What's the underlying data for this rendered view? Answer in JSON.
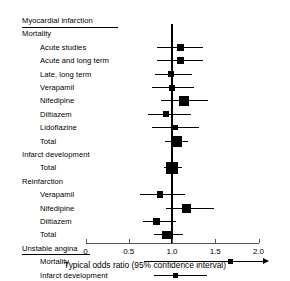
{
  "chart_data": {
    "type": "scatter",
    "subtype": "forest-plot",
    "title": "",
    "xlabel": "Typical odds ratio (95% confidence interval)",
    "ylabel": "",
    "xlim": [
      0,
      2.0
    ],
    "xticks": [
      0,
      0.5,
      1.0,
      1.5,
      2.0
    ],
    "xticklabels": [
      "0",
      "0.5",
      "1.0",
      "1.5",
      "2.0"
    ],
    "null_line": 1.0,
    "grid": false,
    "legend": null,
    "sections": [
      {
        "header": "Myocardial infarction",
        "underline": true,
        "subsections": [
          {
            "header": "Mortality",
            "underline": false,
            "rows": [
              {
                "label": "Acute studies",
                "or": 1.1,
                "ci_low": 0.83,
                "ci_high": 1.36,
                "marker_size": 7.0,
                "truncated_high": false
              },
              {
                "label": "Acute and long term",
                "or": 1.1,
                "ci_low": 0.83,
                "ci_high": 1.36,
                "marker_size": 7.0,
                "truncated_high": false
              },
              {
                "label": "Late, long term",
                "or": 0.99,
                "ci_low": 0.8,
                "ci_high": 1.23,
                "marker_size": 5.4,
                "truncated_high": false
              },
              {
                "label": "Verapamil",
                "or": 1.0,
                "ci_low": 0.77,
                "ci_high": 1.25,
                "marker_size": 6.0,
                "truncated_high": false
              },
              {
                "label": "Nifedipine",
                "or": 1.14,
                "ci_low": 0.87,
                "ci_high": 1.42,
                "marker_size": 9.4,
                "truncated_high": false
              },
              {
                "label": "Diltiazem",
                "or": 0.93,
                "ci_low": 0.72,
                "ci_high": 1.22,
                "marker_size": 6.2,
                "truncated_high": false
              },
              {
                "label": "Lidoflazine",
                "or": 1.04,
                "ci_low": 0.77,
                "ci_high": 1.31,
                "marker_size": 4.8,
                "truncated_high": false
              },
              {
                "label": "Total",
                "or": 1.05,
                "ci_low": 0.92,
                "ci_high": 1.18,
                "marker_size": 11.0,
                "truncated_high": false
              }
            ]
          },
          {
            "header": "Infarct development",
            "underline": false,
            "rows": [
              {
                "label": "Total",
                "or": 1.0,
                "ci_low": 0.91,
                "ci_high": 1.12,
                "marker_size": 11.6,
                "truncated_high": false
              }
            ]
          },
          {
            "header": "Reinfarction",
            "underline": false,
            "rows": [
              {
                "label": "Verapamil",
                "or": 0.86,
                "ci_low": 0.63,
                "ci_high": 1.15,
                "marker_size": 6.6,
                "truncated_high": false
              },
              {
                "label": "Nifedipine",
                "or": 1.17,
                "ci_low": 0.93,
                "ci_high": 1.49,
                "marker_size": 9.0,
                "truncated_high": false
              },
              {
                "label": "Diltiazem",
                "or": 0.82,
                "ci_low": 0.66,
                "ci_high": 1.05,
                "marker_size": 7.6,
                "truncated_high": false
              },
              {
                "label": "Total",
                "or": 0.94,
                "ci_low": 0.79,
                "ci_high": 1.13,
                "marker_size": 8.8,
                "truncated_high": false
              }
            ]
          }
        ]
      },
      {
        "header": "Unstable angina",
        "underline": true,
        "subsections": [
          {
            "header": "",
            "underline": false,
            "rows": [
              {
                "label": "Mortality",
                "or": 1.68,
                "ci_low": 0.68,
                "ci_high": 2.15,
                "marker_size": 5.0,
                "truncated_high": true
              },
              {
                "label": "Infarct development",
                "or": 1.04,
                "ci_low": 0.79,
                "ci_high": 1.4,
                "marker_size": 5.2,
                "truncated_high": false
              }
            ]
          }
        ]
      }
    ]
  },
  "colors": {
    "marker": "#000000",
    "line": "#000000",
    "axis": "#555555",
    "background": "#ffffff"
  }
}
